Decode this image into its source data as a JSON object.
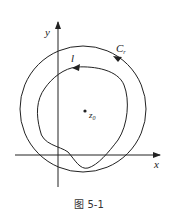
{
  "figure": {
    "caption": "图 5-1",
    "labels": {
      "y_axis": "y",
      "x_axis": "x",
      "circle": "C",
      "circle_sub": "r",
      "curve": "l",
      "point": "z",
      "point_sub": "0"
    }
  },
  "colors": {
    "stroke": "#222222",
    "background": "#ffffff"
  }
}
